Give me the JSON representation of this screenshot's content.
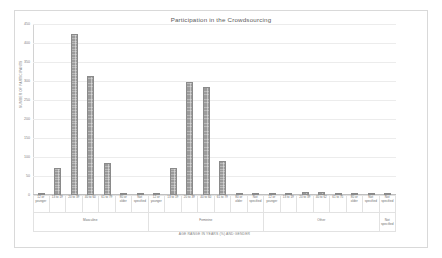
{
  "chart_data": {
    "type": "bar",
    "title": "Participation in the Crowdsourcing",
    "xlabel": "AGE RANGE IN YEARS (%) AND GENDER",
    "ylabel": "NUMBER OF PARTICIPANTS",
    "ylim": [
      0,
      450
    ],
    "grid": true,
    "legend": "none",
    "yticks": [
      "0",
      "50",
      "100",
      "150",
      "200",
      "250",
      "300",
      "350",
      "400",
      "450"
    ],
    "ytick_values": [
      0,
      50,
      100,
      150,
      200,
      250,
      300,
      350,
      400,
      450
    ],
    "groups": [
      {
        "name": "Masculine",
        "categories": [
          "12 or\nyounger",
          "13 to 19",
          "20 to 39",
          "40 to 60",
          "61 to 79",
          "80 or\nolder",
          "Not\nspecified"
        ],
        "values": [
          4,
          72,
          425,
          312,
          85,
          6,
          6
        ]
      },
      {
        "name": "Feminine",
        "categories": [
          "12 or\nyounger",
          "13 to 19",
          "20 to 39",
          "40 to 60",
          "61 to 79",
          "80 or\nolder",
          "Not\nspecified"
        ],
        "values": [
          4,
          72,
          298,
          283,
          90,
          5,
          4
        ]
      },
      {
        "name": "Other",
        "categories": [
          "12 or\nyounger",
          "13 to 19",
          "20 to 39",
          "40 to 62",
          "61 to 75",
          "80 or\nolder",
          "Not\nspecified"
        ],
        "values": [
          2,
          3,
          8,
          8,
          3,
          2,
          2
        ]
      },
      {
        "name": "Not\nspecified",
        "categories": [
          "Not\nspecified"
        ],
        "values": [
          3
        ]
      }
    ]
  }
}
